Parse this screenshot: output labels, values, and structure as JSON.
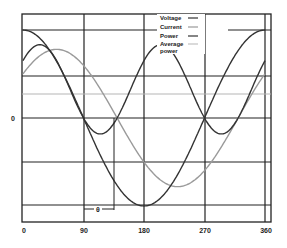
{
  "chart_data": {
    "type": "line",
    "title": "",
    "xlabel": "",
    "ylabel": "",
    "x_ticks": [
      "0",
      "90",
      "180",
      "270",
      "360"
    ],
    "x_range": [
      0,
      360
    ],
    "y_ticks": [
      "0"
    ],
    "grid": true,
    "legend_position": "top-right (inside plot)",
    "phase_angle_label": "θ",
    "phase_angle_deg": 50,
    "series": [
      {
        "name": "Voltage",
        "shape": "cosine",
        "amplitude": 1.0,
        "phase_lag_deg": 0,
        "color": "#333333"
      },
      {
        "name": "Current",
        "shape": "cosine",
        "amplitude": 0.78,
        "phase_lag_deg": 50,
        "color": "#9a9a9a"
      },
      {
        "name": "Power",
        "shape": "product v*i",
        "color": "#333333"
      },
      {
        "name": "Average power",
        "shape": "constant",
        "color": "#b5b5b5"
      }
    ]
  },
  "legend": {
    "items": [
      {
        "label": "Voltage",
        "color": "#333333"
      },
      {
        "label": "Current",
        "color": "#9a9a9a"
      },
      {
        "label": "Power",
        "color": "#333333"
      },
      {
        "label": "Average",
        "label2": "power",
        "color": "#b5b5b5"
      }
    ]
  },
  "axis": {
    "zero_label": "0",
    "x_labels": [
      "0",
      "90",
      "180",
      "270",
      "360"
    ],
    "phase_marker": "θ"
  }
}
